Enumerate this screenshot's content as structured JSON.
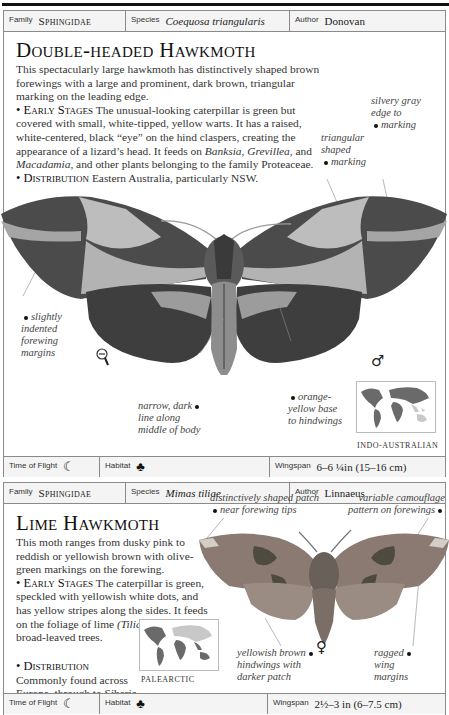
{
  "entries": [
    {
      "header": {
        "family_label": "Family",
        "family": "Sphingidae",
        "species_label": "Species",
        "species": "Coequosa triangularis",
        "author_label": "Author",
        "author": "Donovan"
      },
      "title": "Double-headed Hawkmoth",
      "intro": "This spectacularly large hawkmoth has distinctively shaped brown forewings with a large and prominent, dark brown, triangular marking on the leading edge.",
      "early_stages_label": "Early Stages",
      "early_stages_text_1": "The unusual-looking caterpillar is green but covered with small, white-tipped, yellow warts. It has a raised, white-centered, black “eye” on the hind claspers, creating the appearance of a lizard’s head. It feeds on ",
      "plant_1": "Banksia",
      "sep_1": ", ",
      "plant_2": "Grevillea",
      "sep_2": ", and ",
      "plant_3": "Macadamia",
      "early_stages_text_2": ", and other plants belonging to the family Proteaceae.",
      "distribution_label": "Distribution",
      "distribution_text": "Eastern Australia, particularly NSW.",
      "annotations": {
        "silvery": "silvery gray edge to marking",
        "triangular": "triangular shaped marking",
        "indented": "slightly indented forewing margins",
        "narrow_line": "narrow, dark line along middle of body",
        "orange_base": "orange-yellow base to hindwings"
      },
      "sex_symbol": "♂",
      "scale_icon": "reduced-size-indicator",
      "map_caption": "INDO-AUSTRALIAN",
      "footer": {
        "time_label": "Time of Flight",
        "time_icon": "☾",
        "habitat_label": "Habitat",
        "habitat_icon": "♣",
        "wingspan_label": "Wingspan",
        "wingspan": "6–6 ¼in (15–16 cm)"
      }
    },
    {
      "header": {
        "family_label": "Family",
        "family": "Sphingidae",
        "species_label": "Species",
        "species": "Mimas tiliae",
        "author_label": "Author",
        "author": "Linnaeus"
      },
      "title": "Lime Hawkmoth",
      "intro": "This moth ranges from dusky pink to reddish or yellowish brown with olive-green markings on the forewing.",
      "early_stages_label": "Early Stages",
      "early_stages_text_1": "The caterpillar is green, speckled with yellowish white dots, and has yellow stripes along the sides. It feeds on the foliage of lime ",
      "plant_1": "(Tilia)",
      "early_stages_text_2": " and other broad-leaved trees.",
      "distribution_label": "Distribution",
      "distribution_text": "Commonly found across Europe, through to Siberia, and also in Japan.",
      "annotations": {
        "patch": "distinctively shaped patch near forewing tips",
        "camouflage": "variable camouflage pattern on forewings",
        "yellowish": "yellowish brown hindwings with darker patch",
        "ragged": "ragged wing margins"
      },
      "sex_symbol": "♀",
      "map_caption": "PALEARCTIC",
      "footer": {
        "time_label": "Time of Flight",
        "time_icon": "☾",
        "habitat_label": "Habitat",
        "habitat_icon": "♣",
        "wingspan_label": "Wingspan",
        "wingspan": "2½–3 in (6–7.5 cm)"
      }
    }
  ],
  "colors": {
    "rule": "#111111",
    "border": "#8a8a8a",
    "header_bg": "#f4f4f4",
    "moth1_dark": "#4a4a4a",
    "moth1_light": "#bdbdbd",
    "moth2_body": "#8a7a72",
    "moth2_dark": "#4e4a40",
    "map_land": "#6a6a6a",
    "map_highlight": "#c8c8c8"
  }
}
